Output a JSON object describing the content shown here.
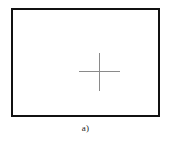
{
  "figure": {
    "caption": "a)",
    "panel_label": "a",
    "colors": {
      "background": "#ffffff",
      "frame_border": "#111111",
      "crosshair": "#8a8a8a",
      "caption_text": "#1a1a1a"
    },
    "frame": {
      "border_width_px": 2.5,
      "x_px": 11,
      "y_px": 8,
      "width_px": 149,
      "height_px": 109
    },
    "crosshair": {
      "icon": "crosshair-icon",
      "center_x_px": 86,
      "center_y_px": 61,
      "horizontal_arm_length_px": 41,
      "vertical_arm_length_px": 38,
      "stroke_px": 1
    }
  }
}
